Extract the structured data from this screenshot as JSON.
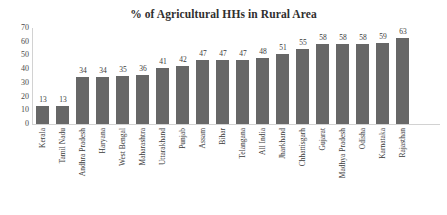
{
  "chart_data": {
    "type": "bar",
    "title": "% of Agricultural HHs in Rural Area",
    "xlabel": "",
    "ylabel": "",
    "ylim": [
      0,
      70
    ],
    "yticks": [
      70,
      60,
      50,
      40,
      30,
      20,
      10,
      0
    ],
    "grid": false,
    "legend": null,
    "bar_color": "#676767",
    "axis_color": "#d2d2d2",
    "categories": [
      "Kerala",
      "Tamil Nadu",
      "Andhra Pradesh",
      "Haryana",
      "West Bengal",
      "Maharashtra",
      "Uttarakhand",
      "Punjab",
      "Assam",
      "Bihar",
      "Telangana",
      "All India",
      "Jharkhand",
      "Chhattisgarh",
      "Gujarat",
      "Madhya Pradesh",
      "Odisha",
      "Karnataka",
      "Rajasthan"
    ],
    "values": [
      13,
      13,
      34,
      34,
      35,
      36,
      41,
      42,
      47,
      47,
      47,
      48,
      51,
      55,
      58,
      58,
      58,
      59,
      63
    ]
  }
}
